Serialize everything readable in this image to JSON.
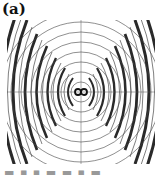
{
  "panel": {
    "label": "(a)",
    "description": "Contour plot of a radiating field pattern: concentric wavefront arcs emanating from a central dipole source, overlaid on a polar/Cartesian grid"
  },
  "plot": {
    "center": "dipole",
    "pattern": "concentric-wavefronts",
    "colors": {
      "contour": "#333333",
      "grid": "#555555",
      "background": "#ffffff"
    }
  },
  "caption": {
    "text": "▬ ▪ ▪ ▬ ▬    ▪ ▬"
  }
}
